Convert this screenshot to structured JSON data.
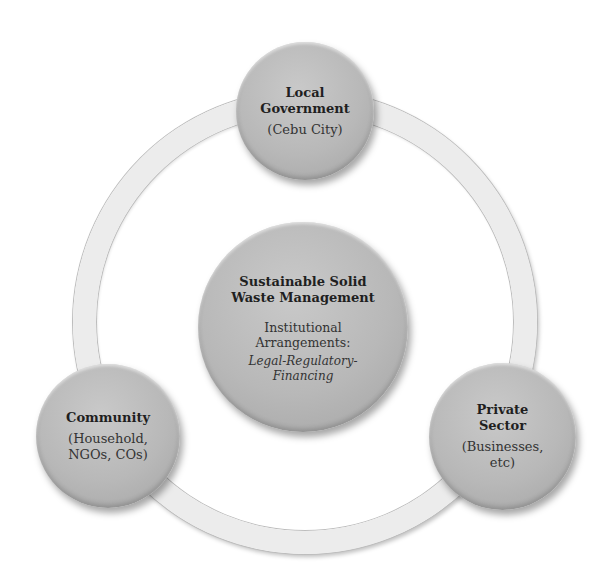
{
  "diagram": {
    "type": "cycle-hub",
    "colors": {
      "node_fill": "#b8b8b8",
      "ring_fill": "#ececec",
      "text": "#2a2a2a",
      "background": "#ffffff"
    },
    "center": {
      "title": "Sustainable Solid Waste Management",
      "title_line1": "Sustainable Solid",
      "title_line2": "Waste Management",
      "subtitle": "Institutional Arrangements:",
      "subtitle_line1": "Institutional",
      "subtitle_line2": "Arrangements:",
      "detail": "Legal-Regulatory-Financing",
      "detail_line1": "Legal-Regulatory-",
      "detail_line2": "Financing"
    },
    "nodes": [
      {
        "position": "top",
        "title_line1": "Local",
        "title_line2": "Government",
        "subtitle": "(Cebu City)"
      },
      {
        "position": "bottom-left",
        "title_line1": "Community",
        "subtitle_line1": "(Household,",
        "subtitle_line2": "NGOs, COs)"
      },
      {
        "position": "bottom-right",
        "title_line1": "Private",
        "title_line2": "Sector",
        "subtitle_line1": "(Businesses,",
        "subtitle_line2": "etc)"
      }
    ]
  }
}
